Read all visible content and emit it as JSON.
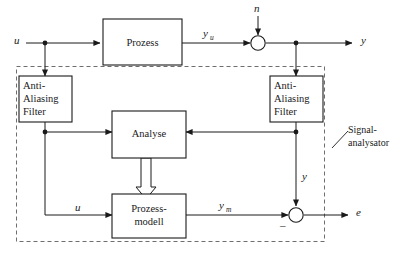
{
  "diagram": {
    "colors": {
      "line": "#1a1a1a",
      "dashed_boundary": "#6e6e6e",
      "background": "#ffffff"
    },
    "blocks": [
      {
        "id": "prozess",
        "label": "Prozess",
        "lines": [
          "Prozess"
        ]
      },
      {
        "id": "aaf_left",
        "label": "Anti-Aliasing Filter",
        "lines": [
          "Anti-",
          "Aliasing",
          "Filter"
        ]
      },
      {
        "id": "aaf_right",
        "label": "Anti-Aliasing Filter",
        "lines": [
          "Anti-",
          "Aliasing",
          "Filter"
        ]
      },
      {
        "id": "analyse",
        "label": "Analyse",
        "lines": [
          "Analyse"
        ]
      },
      {
        "id": "prozessmodell",
        "label": "Prozess-modell",
        "lines": [
          "Prozess-",
          "modell"
        ]
      }
    ],
    "signals": {
      "u_in": "u",
      "y_u_base": "y",
      "y_u_sub": "u",
      "n": "n",
      "y_out": "y",
      "u_model": "u",
      "y_m_base": "y",
      "y_m_sub": "m",
      "y_feedback": "y",
      "e_out": "e",
      "minus_sign": "_"
    },
    "annotation": {
      "signalanalysator_line1": "Signal-",
      "signalanalysator_line2": "analysator"
    },
    "caption": ""
  }
}
